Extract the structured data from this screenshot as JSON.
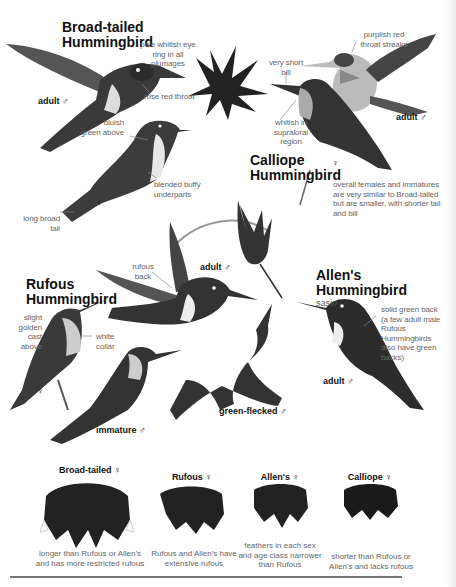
{
  "species": {
    "broad_tailed": {
      "title_line1": "Broad-tailed",
      "title_line2": "Hummingbird",
      "labels": {
        "eye_ring": "pale whitish eye ring in all plumages",
        "eye_ring_l1": "pale whitish eye",
        "eye_ring_l2": "ring in all",
        "eye_ring_l3": "plumages",
        "throat": "rose red throat",
        "above_l1": "bluish",
        "above_l2": "green above",
        "underparts_l1": "blended buffy",
        "underparts_l2": "underparts",
        "tail_l1": "long broad",
        "tail_l2": "tail"
      },
      "tags": {
        "male": "adult ♂",
        "female": "♀"
      }
    },
    "calliope": {
      "title_line1": "Calliope",
      "title_line2": "Hummingbird",
      "labels": {
        "throat_l1": "purplish red",
        "throat_l2": "throat streaks",
        "bill_l1": "very short",
        "bill_l2": "bill",
        "supraloral_l1": "whitish in",
        "supraloral_l2": "supraloral",
        "supraloral_l3": "region",
        "overall_l1": "overall females and immatures",
        "overall_l2": "are very similar to Broad-tailed",
        "overall_l3": "but are smaller, with shorter tail",
        "overall_l4": "and bill"
      },
      "tags": {
        "male": "adult ♂",
        "female": "♀"
      }
    },
    "rufous": {
      "title_line1": "Rufous",
      "title_line2": "Hummingbird",
      "labels": {
        "back_l1": "rufous",
        "back_l2": "back",
        "golden_l1": "slight",
        "golden_l2": "golden cast",
        "golden_l3": "above",
        "collar_l1": "white",
        "collar_l2": "collar"
      },
      "tags": {
        "male": "adult ♂",
        "female": "♀",
        "immature": "immature ♂",
        "green_flecked": "green-flecked ♂"
      }
    },
    "allens": {
      "title_line1": "Allen's",
      "title_line2": "Hummingbird",
      "subtitle": "sasin",
      "labels": {
        "back_l1": "solid green back",
        "back_l2": "(a few adult male",
        "back_l3": "Rufous Hummingbirds",
        "back_l4": "also have green backs)"
      },
      "tags": {
        "male": "adult ♂"
      }
    }
  },
  "tails": [
    {
      "title": "Broad-tailed ♀",
      "note_l1": "longer than Rufous or Allen's",
      "note_l2": "and has more restricted rufous"
    },
    {
      "title": "Rufous ♀",
      "note_l1": "Rufous and Allen's have",
      "note_l2": "extensive rufous"
    },
    {
      "title": "Allen's ♀",
      "note_l1": "feathers in each sex",
      "note_l2": "and age class narrower",
      "note_l3": "than Rufous"
    },
    {
      "title": "Calliope ♀",
      "note_l1": "shorter than Rufous or",
      "note_l2": "Allen's and lacks rufous"
    }
  ],
  "colors": {
    "ink": "#111111",
    "note": "#666666",
    "bird": "#2a2a2a",
    "rule": "#777777"
  }
}
